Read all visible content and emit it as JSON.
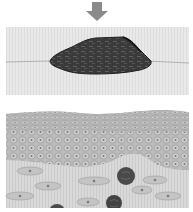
{
  "figure": {
    "type": "skin-cross-section-illustration",
    "text_labels": [],
    "colors": {
      "background": "#ffffff",
      "arrow": "#8a8a8a",
      "outer_layer": "#e6e6e6",
      "outer_layer_stripe": "#d9d9d9",
      "surface_line": "#9a9a9a",
      "lesion_fill": "#3c3c3c",
      "lesion_outline": "#1e1e1e",
      "lesion_texture": "#6a6a6a",
      "epidermis": "#bdbdbd",
      "cell_fill": "#cfcfcf",
      "cell_outline": "#8f8f8f",
      "nucleus": "#7a7a7a",
      "dermis": "#d6d6d6",
      "dermis_stripe": "#cacaca",
      "spindle_cell": "#c4c4c4",
      "round_cell": "#4a4a4a"
    },
    "elements": {
      "arrow": {
        "name": "pressure-arrow",
        "direction": "down"
      },
      "lesion": {
        "name": "dark-lesion-on-surface"
      },
      "epidermis": {
        "name": "cellular-layer"
      },
      "dermis": {
        "name": "connective-tissue-layer"
      },
      "round_cells": [
        {
          "cx": 126,
          "cy": 176,
          "r": 9
        },
        {
          "cx": 114,
          "cy": 202,
          "r": 8
        },
        {
          "cx": 57,
          "cy": 209,
          "r": 7
        }
      ],
      "spindle_cells": [
        {
          "cx": 30,
          "cy": 171,
          "rx": 13,
          "ry": 4
        },
        {
          "cx": 48,
          "cy": 186,
          "rx": 13,
          "ry": 4
        },
        {
          "cx": 94,
          "cy": 181,
          "rx": 16,
          "ry": 4
        },
        {
          "cx": 155,
          "cy": 180,
          "rx": 12,
          "ry": 4
        },
        {
          "cx": 142,
          "cy": 190,
          "rx": 10,
          "ry": 4
        },
        {
          "cx": 20,
          "cy": 196,
          "rx": 14,
          "ry": 4
        },
        {
          "cx": 88,
          "cy": 202,
          "rx": 11,
          "ry": 4
        },
        {
          "cx": 168,
          "cy": 196,
          "rx": 13,
          "ry": 4
        }
      ]
    }
  }
}
